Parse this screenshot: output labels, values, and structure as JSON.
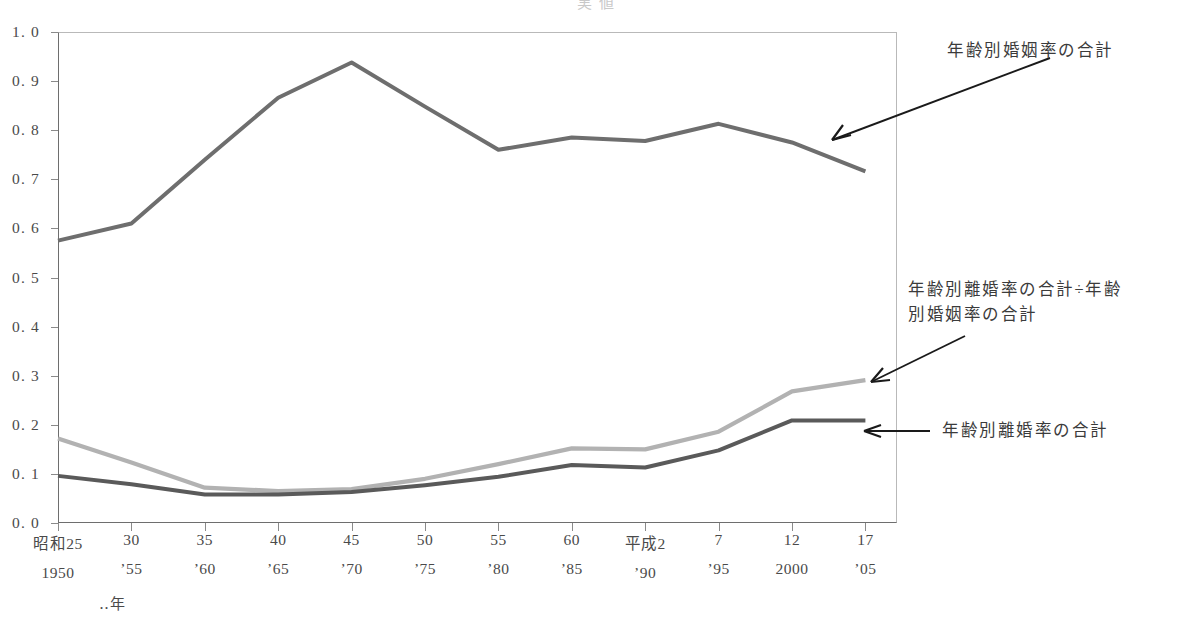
{
  "title_sliver": "実 値",
  "axis_unit_label": "‥年",
  "yaxis": {
    "ticks": [
      "1. 0",
      "0. 9",
      "0. 8",
      "0. 7",
      "0. 6",
      "0. 5",
      "0. 4",
      "0. 3",
      "0. 2",
      "0. 1",
      "0. 0"
    ],
    "min": 0.0,
    "max": 1.0,
    "step": 0.1
  },
  "xaxis": {
    "era_labels": [
      "昭和25",
      "30",
      "35",
      "40",
      "45",
      "50",
      "55",
      "60",
      "平成2",
      "7",
      "12",
      "17"
    ],
    "west_labels": [
      "1950",
      "’55",
      "’60",
      "’65",
      "’70",
      "’75",
      "’80",
      "’85",
      "’90",
      "’95",
      "2000",
      "’05"
    ]
  },
  "annotations": {
    "marriage": "年齢別婚姻率の合計",
    "ratio": "年齢別離婚率の合計÷年齢\n別婚姻率の合計",
    "divorce": "年齢別離婚率の合計"
  },
  "colors": {
    "marriage_line": "#6e6e6e",
    "ratio_line": "#b2b2b2",
    "divorce_line": "#5a5a5a",
    "axis": "#8a8a8a",
    "text": "#3b3b3b"
  },
  "chart_data": {
    "type": "line",
    "title": "実 値",
    "xlabel": "‥年",
    "ylabel": "",
    "ylim": [
      0.0,
      1.0
    ],
    "grid": false,
    "legend": "annotations-with-arrows",
    "categories": [
      "1950",
      "1955",
      "1960",
      "1965",
      "1970",
      "1975",
      "1980",
      "1985",
      "1990",
      "1995",
      "2000",
      "2005"
    ],
    "era_categories": [
      "昭和25",
      "昭和30",
      "昭和35",
      "昭和40",
      "昭和45",
      "昭和50",
      "昭和55",
      "昭和60",
      "平成2",
      "平成7",
      "平成12",
      "平成17"
    ],
    "series": [
      {
        "name": "年齢別婚姻率の合計",
        "color": "#6e6e6e",
        "values": [
          0.575,
          0.61,
          0.74,
          0.866,
          0.938,
          0.848,
          0.76,
          0.785,
          0.778,
          0.813,
          0.775,
          0.716
        ]
      },
      {
        "name": "年齢別離婚率の合計÷年齢別婚姻率の合計",
        "color": "#b2b2b2",
        "values": [
          0.172,
          0.123,
          0.072,
          0.065,
          0.069,
          0.09,
          0.12,
          0.152,
          0.15,
          0.186,
          0.268,
          0.291
        ]
      },
      {
        "name": "年齢別離婚率の合計",
        "color": "#5a5a5a",
        "values": [
          0.096,
          0.079,
          0.058,
          0.058,
          0.063,
          0.077,
          0.094,
          0.118,
          0.113,
          0.148,
          0.209,
          0.209
        ]
      }
    ]
  },
  "plot_geometry": {
    "left": 58,
    "top": 32,
    "width": 839,
    "height": 491,
    "x_step": 73.4
  }
}
